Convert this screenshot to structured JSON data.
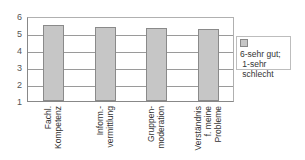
{
  "chart_data": {
    "type": "bar",
    "title": "",
    "xlabel": "",
    "ylabel": "",
    "categories": [
      "Fachl.\nKompetenz",
      "Inform.-\nvermittlung",
      "Gruppen-\nmoderation",
      "Verständnis\nf. meine\nProbleme"
    ],
    "series": [
      {
        "name": "6-sehr gut; 1-sehr schlecht",
        "values": [
          5.47,
          5.33,
          5.29,
          5.25
        ],
        "color": "#c6c6c6"
      }
    ],
    "ylim": [
      1,
      6
    ],
    "yticks": [
      "1",
      "2",
      "3",
      "4",
      "5",
      "6"
    ],
    "grid": true,
    "legend_position": "right"
  },
  "legend": {
    "label": "6-sehr gut;\n 1-sehr\n schlecht"
  }
}
